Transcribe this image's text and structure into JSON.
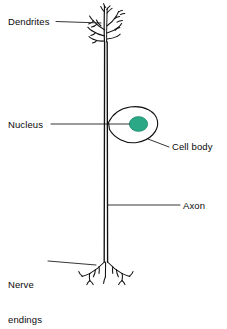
{
  "diagram": {
    "background_color": "#ffffff",
    "ink_color": "#111111",
    "nucleus_color": "#2ba886",
    "nucleus_stroke_color": "#1c8a6c",
    "labels": {
      "dendrites": "Dendrites",
      "nucleus": "Nucleus",
      "cell_body": "Cell body",
      "axon": "Axon",
      "nerve_endings_line1": "Nerve",
      "nerve_endings_line2": "endings"
    },
    "parts": [
      {
        "name": "dendrites",
        "label": "Dendrites",
        "description": "Branching tree-like fibers at the top of the neuron"
      },
      {
        "name": "nucleus",
        "label": "Nucleus",
        "description": "Teal filled oval inside the cell body"
      },
      {
        "name": "cell-body",
        "label": "Cell body",
        "description": "Teardrop shaped soma attached to the side of the axon"
      },
      {
        "name": "axon",
        "label": "Axon",
        "description": "Long vertical double-line fiber running down the diagram"
      },
      {
        "name": "nerve-endings",
        "label": "Nerve endings",
        "description": "Small branching terminals at the bottom of the axon"
      }
    ]
  }
}
